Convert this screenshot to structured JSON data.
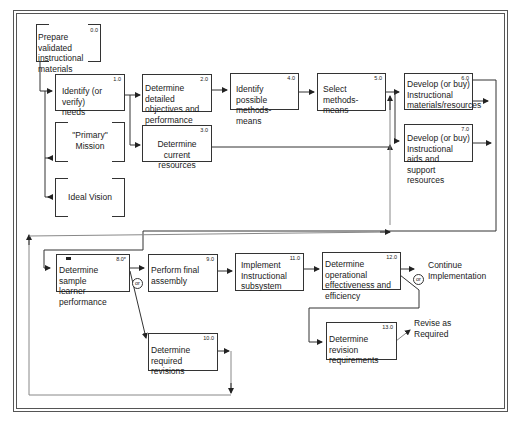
{
  "diagram": {
    "type": "flowchart",
    "boxes": [
      {
        "id": "0.0",
        "number": "0.0",
        "label": "Prepare validated instructional materials",
        "lines": [
          "Prepare validated",
          "instructional",
          "materials"
        ],
        "style": "bracket"
      },
      {
        "id": "1.0",
        "number": "1.0",
        "label": "Identify (or verify) needs",
        "lines": [
          "Identify (or verify)",
          "needs"
        ],
        "style": "box"
      },
      {
        "id": "primary",
        "number": "",
        "label": "\"Primary\" Mission",
        "lines": [
          "\"Primary\"",
          "Mission"
        ],
        "style": "bracket"
      },
      {
        "id": "ideal",
        "number": "",
        "label": "Ideal Vision",
        "lines": [
          "Ideal Vision"
        ],
        "style": "bracket"
      },
      {
        "id": "2.0",
        "number": "2.0",
        "label": "Determine detailed objectives and performance",
        "lines": [
          "Determine detailed",
          "objectives and",
          "performance"
        ],
        "style": "box"
      },
      {
        "id": "3.0",
        "number": "3.0",
        "label": "Determine current resources",
        "lines": [
          "Determine current",
          "resources"
        ],
        "style": "box"
      },
      {
        "id": "4.0",
        "number": "4.0",
        "label": "Identify possible methods-means",
        "lines": [
          "Identify possible",
          "methods-means"
        ],
        "style": "box"
      },
      {
        "id": "5.0",
        "number": "5.0",
        "label": "Select methods-means",
        "lines": [
          "Select",
          "methods-means"
        ],
        "style": "box"
      },
      {
        "id": "6.0",
        "number": "6.0",
        "label": "Develop (or buy) Instructional materials/resources",
        "lines": [
          "Develop (or buy)",
          "Instructional",
          "materials/resources"
        ],
        "style": "box"
      },
      {
        "id": "7.0",
        "number": "7.0",
        "label": "Develop (or buy) Instructional aids and support resources",
        "lines": [
          "Develop (or buy)",
          "Instructional aids and",
          "support resources"
        ],
        "style": "box"
      },
      {
        "id": "8.0",
        "number": "8.0*",
        "label": "Determine sample learner performance",
        "lines": [
          "Determine sample",
          "learner performance"
        ],
        "style": "box"
      },
      {
        "id": "9.0",
        "number": "9.0",
        "label": "Perform final assembly",
        "lines": [
          "Perform final",
          "assembly"
        ],
        "style": "box"
      },
      {
        "id": "10.0",
        "number": "10.0",
        "label": "Determine required revisions",
        "lines": [
          "Determine required",
          "revisions"
        ],
        "style": "box"
      },
      {
        "id": "11.0",
        "number": "11.0",
        "label": "Implement Instructional subsystem",
        "lines": [
          "Implement",
          "Instructional",
          "subsystem"
        ],
        "style": "box"
      },
      {
        "id": "12.0",
        "number": "12.0",
        "label": "Determine operational effectiveness and efficiency",
        "lines": [
          "Determine operational",
          "effectiveness and",
          "efficiency"
        ],
        "style": "box"
      },
      {
        "id": "13.0",
        "number": "13.0",
        "label": "Determine revision requirements",
        "lines": [
          "Determine revision",
          "requirements"
        ],
        "style": "box"
      }
    ],
    "free_labels": {
      "continue": [
        "Continue",
        "Implementation"
      ],
      "revise": [
        "Revise as",
        "Required"
      ]
    },
    "or_label": "or",
    "edges": [
      {
        "from": "0.0",
        "to": "1.0"
      },
      {
        "from": "1.0",
        "to": "primary"
      },
      {
        "from": "1.0",
        "to": "ideal"
      },
      {
        "from": "1.0",
        "to": "2.0"
      },
      {
        "from": "1.0",
        "to": "3.0"
      },
      {
        "from": "2.0",
        "to": "4.0"
      },
      {
        "from": "4.0",
        "to": "5.0"
      },
      {
        "from": "5.0",
        "to": "6.0"
      },
      {
        "from": "5.0",
        "to": "7.0"
      },
      {
        "from": "3.0",
        "to": "6.0/7.0"
      },
      {
        "from": "6.0",
        "to": "8.0"
      },
      {
        "from": "7.0",
        "to": "8.0"
      },
      {
        "from": "8.0",
        "to": "9.0",
        "condition": "or"
      },
      {
        "from": "8.0",
        "to": "10.0",
        "condition": "or"
      },
      {
        "from": "10.0",
        "to": "5.0/6.0/7.0",
        "note": "loop back"
      },
      {
        "from": "9.0",
        "to": "11.0"
      },
      {
        "from": "11.0",
        "to": "12.0"
      },
      {
        "from": "12.0",
        "to": "Continue Implementation",
        "condition": "or"
      },
      {
        "from": "12.0",
        "to": "13.0",
        "condition": "or"
      },
      {
        "from": "13.0",
        "to": "Revise as Required"
      }
    ]
  }
}
